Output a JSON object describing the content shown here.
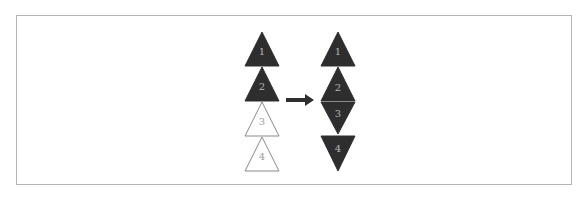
{
  "diagram": {
    "colors": {
      "filled": "#2e2e2e",
      "outline": "#8a8a8a",
      "filled_label": "#b8b8b8",
      "outline_label": "#9a9a9a",
      "arrow": "#2e2e2e",
      "border": "#b5b5b5",
      "separator": "#e8e8e8"
    },
    "left_stack": {
      "triangles": [
        {
          "label": "1",
          "style": "filled",
          "orientation": "up"
        },
        {
          "label": "2",
          "style": "filled",
          "orientation": "up"
        },
        {
          "label": "3",
          "style": "outline",
          "orientation": "up"
        },
        {
          "label": "4",
          "style": "outline",
          "orientation": "up"
        }
      ]
    },
    "arrow": {
      "direction": "right"
    },
    "right_stack": {
      "triangles": [
        {
          "label": "1",
          "style": "filled",
          "orientation": "up"
        },
        {
          "label": "2",
          "style": "filled",
          "orientation": "up"
        },
        {
          "label": "3",
          "style": "filled",
          "orientation": "down"
        },
        {
          "label": "4",
          "style": "filled",
          "orientation": "down"
        }
      ]
    }
  }
}
